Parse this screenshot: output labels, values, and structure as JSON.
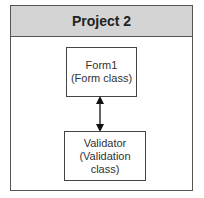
{
  "project": {
    "title": "Project 2"
  },
  "nodes": [
    {
      "id": "form1",
      "name": "Form1",
      "type": "(Form class)"
    },
    {
      "id": "validator",
      "name": "Validator",
      "type_line1": "(Validation",
      "type_line2": "class)"
    }
  ],
  "edges": [
    {
      "from": "form1",
      "to": "validator",
      "direction": "bidirectional"
    }
  ],
  "colors": {
    "header_bg": "#d4d4d4",
    "border": "#555555"
  }
}
